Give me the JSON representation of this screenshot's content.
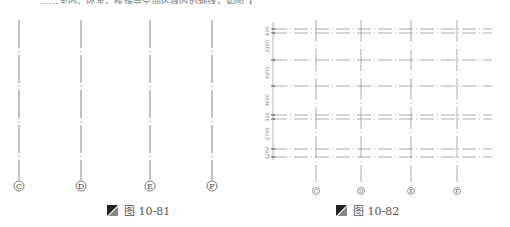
{
  "top_text": "……室内、卧室、楼梯等空间区域内的轴线，如图 10-82 所示。",
  "figure_left": {
    "axes": [
      {
        "label": "C",
        "x": 19
      },
      {
        "label": "D",
        "x": 81
      },
      {
        "label": "E",
        "x": 150
      },
      {
        "label": "F",
        "x": 212
      }
    ],
    "caption": {
      "icon": "figure-icon",
      "label": "图 10-81"
    }
  },
  "figure_right": {
    "axes": [
      {
        "label": "C",
        "x": 316
      },
      {
        "label": "D",
        "x": 361
      },
      {
        "label": "E",
        "x": 411
      },
      {
        "label": "F",
        "x": 457
      }
    ],
    "horizontal_lines_y": [
      29,
      33,
      60,
      86,
      115,
      119,
      149,
      157
    ],
    "dimensions": [
      "600",
      "3300",
      "3300",
      "3600",
      "300",
      "2700",
      "1200"
    ],
    "caption": {
      "icon": "figure-icon",
      "label": "图 10-82"
    }
  }
}
